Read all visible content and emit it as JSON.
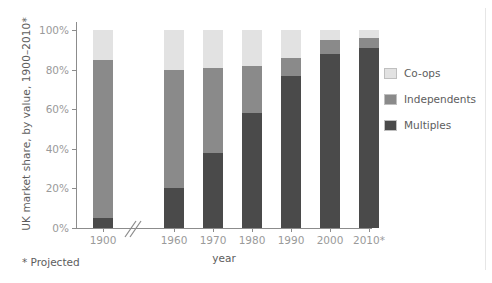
{
  "chart_data": {
    "type": "bar",
    "subtype": "stacked-bar-100",
    "title": "",
    "xlabel": "year",
    "ylabel": "UK market share, by value, 1900–2010*",
    "categories": [
      "1900",
      "1960",
      "1970",
      "1980",
      "1990",
      "2000",
      "2010*"
    ],
    "ylim": [
      0,
      100
    ],
    "yticks": [
      0,
      20,
      40,
      60,
      80,
      100
    ],
    "ytick_labels": [
      "0%",
      "20%",
      "40%",
      "60%",
      "80%",
      "100%"
    ],
    "grid": false,
    "legend_position": "right",
    "axis_break": "x-axis break between 1900 and 1960",
    "series": [
      {
        "name": "Multiples",
        "color": "#4a4a4a",
        "values": [
          5,
          20,
          38,
          58,
          77,
          88,
          91
        ]
      },
      {
        "name": "Independents",
        "color": "#8a8a8a",
        "values": [
          80,
          60,
          43,
          24,
          9,
          7,
          5
        ]
      },
      {
        "name": "Co-ops",
        "color": "#e2e2e2",
        "values": [
          15,
          20,
          19,
          18,
          14,
          5,
          4
        ]
      }
    ],
    "annotations": [
      "* Projected"
    ]
  },
  "axis": {
    "ylabel": "UK market share, by value, 1900–2010*",
    "xlabel": "year",
    "ytick_labels": [
      "100%",
      "80%",
      "60%",
      "40%",
      "20%",
      "0%"
    ],
    "xtick_labels": [
      "1900",
      "1960",
      "1970",
      "1980",
      "1990",
      "2000",
      "2010*"
    ]
  },
  "legend": {
    "items": [
      {
        "label": "Co-ops",
        "color": "#e2e2e2"
      },
      {
        "label": "Independents",
        "color": "#8a8a8a"
      },
      {
        "label": "Multiples",
        "color": "#4a4a4a"
      }
    ]
  },
  "footnote": "* Projected"
}
